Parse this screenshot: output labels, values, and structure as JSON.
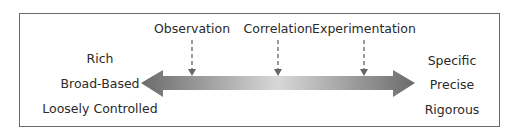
{
  "methods": [
    {
      "label": "Observation",
      "x": 192
    },
    {
      "label": "Correlation",
      "x": 278
    },
    {
      "label": "Experimentation",
      "x": 364
    }
  ],
  "left_attributes": [
    "Rich",
    "Broad-Based",
    "Loosely Controlled"
  ],
  "right_attributes": [
    "Specific",
    "Precise",
    "Rigorous"
  ],
  "colors": {
    "arrow_dark": "#6b6b6b",
    "arrow_light": "#d6d6d6",
    "border": "#6a6a6a",
    "text": "#2a2a2a"
  }
}
